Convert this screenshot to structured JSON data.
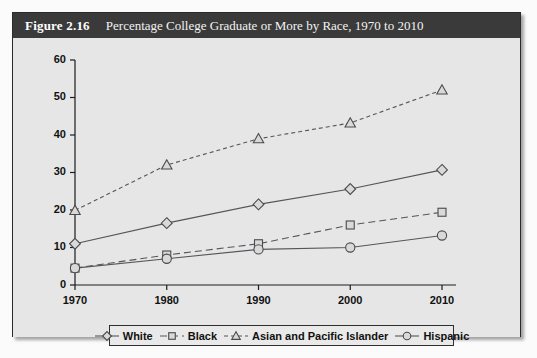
{
  "figure": {
    "number_label": "Figure 2.16",
    "title": "Percentage College Graduate or More by Race, 1970 to 2010",
    "caption": ""
  },
  "colors": {
    "title_bar_bg": "#3a3a3a",
    "title_text": "#ffffff",
    "plot_bg": "#e6e6e6",
    "line": "#55565a",
    "marker_fill": "#d9d9d9",
    "marker_stroke": "#4a4a4e",
    "axis": "#1c1c1c",
    "border": "#2b2b2b"
  },
  "legend": {
    "items": [
      {
        "label": "White",
        "marker": "diamond",
        "dash": "solid"
      },
      {
        "label": "Black",
        "marker": "square",
        "dash": "dashed"
      },
      {
        "label": "Asian and Pacific Islander",
        "marker": "triangle",
        "dash": "dotted"
      },
      {
        "label": "Hispanic",
        "marker": "circle",
        "dash": "solid"
      }
    ]
  },
  "chart_data": {
    "type": "line",
    "title": "Percentage College Graduate or More by Race, 1970 to 2010",
    "xlabel": "",
    "ylabel": "",
    "categories": [
      "1970",
      "1980",
      "1990",
      "2000",
      "2010"
    ],
    "x": [
      1970,
      1980,
      1990,
      2000,
      2010
    ],
    "xlim": [
      1970,
      2010
    ],
    "ylim": [
      0,
      60
    ],
    "yticks": [
      0,
      10,
      20,
      30,
      40,
      50,
      60
    ],
    "xticks": [
      "1970",
      "1980",
      "1990",
      "2000",
      "2010"
    ],
    "grid": false,
    "legend_position": "bottom",
    "series": [
      {
        "name": "White",
        "marker": "diamond",
        "dash": "solid",
        "values": [
          11.0,
          16.5,
          21.5,
          25.6,
          30.7
        ]
      },
      {
        "name": "Black",
        "marker": "square",
        "dash": "dashed",
        "values": [
          4.5,
          8.0,
          11.0,
          16.0,
          19.4
        ]
      },
      {
        "name": "Asian and Pacific Islander",
        "marker": "triangle",
        "dash": "dotted",
        "values": [
          19.9,
          32.0,
          39.0,
          43.2,
          52.0
        ]
      },
      {
        "name": "Hispanic",
        "marker": "circle",
        "dash": "solid",
        "values": [
          4.5,
          7.0,
          9.5,
          10.0,
          13.2
        ]
      }
    ]
  }
}
